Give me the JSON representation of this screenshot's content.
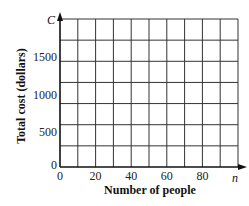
{
  "chart_data": {
    "type": "line",
    "title": "",
    "xlabel": "Number of people",
    "ylabel": "Total cost (dollars)",
    "x_axis_variable": "n",
    "y_axis_variable": "C",
    "xlim": [
      0,
      100
    ],
    "ylim": [
      0,
      1750
    ],
    "x_ticks": [
      0,
      20,
      40,
      60,
      80
    ],
    "y_ticks": [
      0,
      500,
      1000,
      1500
    ],
    "x_grid_step": 10,
    "y_grid_step": 250,
    "grid": true,
    "series": []
  },
  "labels": {
    "x_origin": "0",
    "y_origin": "0",
    "x_tick_labels": [
      "20",
      "40",
      "60",
      "80"
    ],
    "y_tick_labels": [
      "500",
      "1000",
      "1500"
    ],
    "x_var": "n",
    "y_var": "C",
    "xlabel": "Number of people",
    "ylabel": "Total cost (dollars)"
  }
}
